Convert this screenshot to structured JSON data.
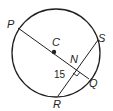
{
  "diagram": {
    "type": "circle-geometry",
    "colors": {
      "stroke": "#231f20",
      "background": "#ffffff"
    },
    "circle": {
      "center_label": "C"
    },
    "points": {
      "P": "P",
      "C": "C",
      "S": "S",
      "N": "N",
      "Q": "Q",
      "R": "R"
    },
    "segments": [
      {
        "from": "P",
        "to": "Q",
        "description": "diameter through C"
      },
      {
        "from": "R",
        "to": "S",
        "description": "chord perpendicular to PQ at N"
      }
    ],
    "measure_label": "15",
    "right_angle_at": "N"
  }
}
